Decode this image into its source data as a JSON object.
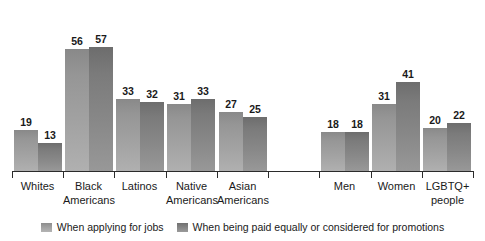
{
  "chart_data": {
    "type": "bar",
    "title": "",
    "subtitle": "",
    "xlabel": "",
    "ylabel": "",
    "ylim": [
      0,
      60
    ],
    "grid": false,
    "legend_position": "bottom",
    "categories": [
      "Whites",
      "Black Americans",
      "Latinos",
      "Native Americans",
      "Asian Americans",
      "",
      "Men",
      "Women",
      "LGBTQ+ people"
    ],
    "series": [
      {
        "name": "When applying for jobs",
        "color": "#a0a0a0",
        "values": [
          19,
          56,
          33,
          31,
          27,
          null,
          18,
          31,
          20
        ]
      },
      {
        "name": "When being paid equally or considered for promotions",
        "color": "#808080",
        "values": [
          13,
          57,
          32,
          33,
          25,
          null,
          18,
          41,
          22
        ]
      }
    ]
  },
  "axis": {
    "line_color": "#2b2b2b"
  },
  "categories_display": [
    {
      "line1": "Whites",
      "line2": ""
    },
    {
      "line1": "Black",
      "line2": "Americans"
    },
    {
      "line1": "Latinos",
      "line2": ""
    },
    {
      "line1": "Native",
      "line2": "Americans"
    },
    {
      "line1": "Asian",
      "line2": "Americans"
    },
    {
      "line1": "",
      "line2": ""
    },
    {
      "line1": "Men",
      "line2": ""
    },
    {
      "line1": "Women",
      "line2": ""
    },
    {
      "line1": "LGBTQ+",
      "line2": "people"
    }
  ],
  "legend": {
    "items": [
      {
        "label": "When applying for jobs"
      },
      {
        "label": "When being paid equally or considered for promotions"
      }
    ]
  }
}
